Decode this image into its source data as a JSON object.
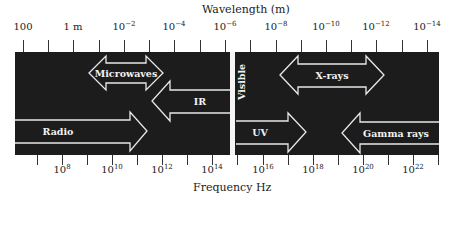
{
  "diagram": {
    "top_axis": {
      "title": "Wavelength (m)",
      "labels": [
        {
          "base": "100",
          "exp": "",
          "x": 23
        },
        {
          "base": "1 m",
          "exp": "",
          "x": 73
        },
        {
          "base": "10",
          "exp": "−2",
          "x": 124
        },
        {
          "base": "10",
          "exp": "−4",
          "x": 174
        },
        {
          "base": "10",
          "exp": "−6",
          "x": 225
        },
        {
          "base": "10",
          "exp": "−8",
          "x": 276
        },
        {
          "base": "10",
          "exp": "−10",
          "x": 326
        },
        {
          "base": "10",
          "exp": "−12",
          "x": 376
        },
        {
          "base": "10",
          "exp": "−14",
          "x": 427
        }
      ],
      "ticks": [
        23,
        48,
        73,
        99,
        124,
        149,
        174,
        200,
        225,
        250,
        276,
        301,
        326,
        351,
        376,
        402,
        427
      ]
    },
    "bottom_axis": {
      "title": "Frequency Hz",
      "labels": [
        {
          "base": "10",
          "exp": "8",
          "x": 62
        },
        {
          "base": "10",
          "exp": "10",
          "x": 112
        },
        {
          "base": "10",
          "exp": "12",
          "x": 162
        },
        {
          "base": "10",
          "exp": "14",
          "x": 212
        },
        {
          "base": "10",
          "exp": "16",
          "x": 263
        },
        {
          "base": "10",
          "exp": "18",
          "x": 313
        },
        {
          "base": "10",
          "exp": "20",
          "x": 363
        },
        {
          "base": "10",
          "exp": "22",
          "x": 413
        }
      ],
      "ticks": [
        37,
        62,
        87,
        112,
        137,
        162,
        187,
        212,
        237,
        263,
        288,
        313,
        338,
        363,
        388,
        413,
        438
      ]
    },
    "regions": {
      "microwaves": "Microwaves",
      "ir": "IR",
      "visible": "Visible",
      "xrays": "X-rays",
      "radio": "Radio",
      "uv": "UV",
      "gamma": "Gamma rays"
    },
    "colors": {
      "band": "#1c1c1c",
      "arrow_stroke": "#e8e8e8",
      "visible_bar": "#f5f5f5"
    }
  }
}
